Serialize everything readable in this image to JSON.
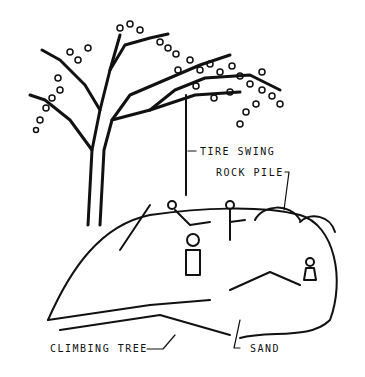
{
  "figure": {
    "type": "line-drawing illustration",
    "colors": {
      "ink": "#111111",
      "background": "#ffffff"
    }
  },
  "labels": {
    "tire_swing": "TIRE SWING",
    "rock_pile": "ROCK PILE",
    "climbing_tree": "CLIMBING TREE",
    "sand": "SAND"
  }
}
